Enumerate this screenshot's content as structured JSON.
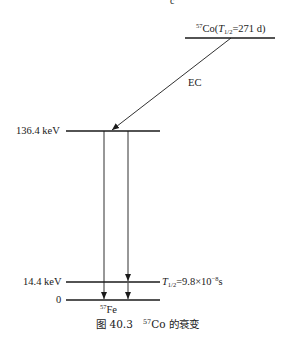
{
  "diagram": {
    "type": "nuclear-decay-scheme",
    "parent": {
      "mass_number": "57",
      "symbol": "Co",
      "half_life_symbol": "T",
      "half_life_sub": "1/2",
      "half_life_value": "=271 d"
    },
    "decay_mode": "EC",
    "levels": [
      {
        "energy_label": "136.4 keV"
      },
      {
        "energy_label": "14.4 keV",
        "half_life_symbol": "T",
        "half_life_sub": "1/2",
        "half_life_value": "=9.8×10",
        "half_life_exp": "−8",
        "half_life_unit": "s"
      },
      {
        "energy_label": "0"
      }
    ],
    "daughter": {
      "mass_number": "57",
      "symbol": "Fe"
    },
    "transitions": [
      {
        "from": "136.4 keV",
        "to": "0"
      },
      {
        "from": "136.4 keV",
        "to": "14.4 keV"
      },
      {
        "from": "14.4 keV",
        "to": "0"
      }
    ]
  },
  "caption": {
    "prefix": "图 40.3",
    "mass_number": "57",
    "symbol": "Co",
    "suffix": " 的衰变"
  },
  "partial_top_text": "c"
}
